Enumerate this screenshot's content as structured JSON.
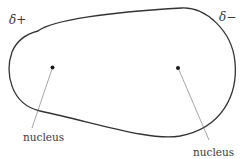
{
  "diagram": {
    "labels": {
      "positive_end": "δ+",
      "negative_end": "δ−",
      "nucleus_left": "nucleus",
      "nucleus_right": "nucleus"
    },
    "nuclei": [
      {
        "name": "nucleus-left",
        "label": "nucleus"
      },
      {
        "name": "nucleus-right",
        "label": "nucleus"
      }
    ],
    "colors": {
      "outline": "#333333",
      "text": "#3a3a3a",
      "nucleus": "#1a1a1a",
      "leader": "#6a6a6a",
      "background": "#ffffff"
    }
  }
}
